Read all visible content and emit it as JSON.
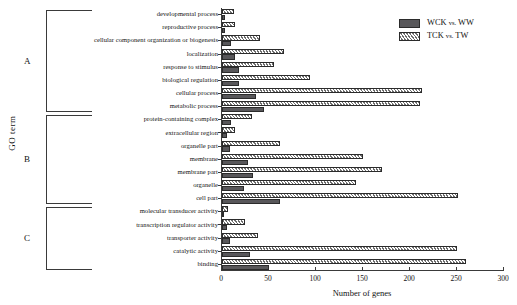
{
  "chart_data": {
    "type": "bar",
    "orientation": "horizontal",
    "title": "",
    "xlabel": "Number of genes",
    "ylabel": "GO term",
    "xlim": [
      0,
      300
    ],
    "xticks": [
      0,
      50,
      100,
      150,
      200,
      250,
      300
    ],
    "grid": false,
    "legend_position": "top-right",
    "categories": [
      "developmental process",
      "reproductive process",
      "cellular component organization or biogenesis",
      "localization",
      "response to stimulus",
      "biological regulation",
      "cellular process",
      "metabolic process",
      "protein-containing complex",
      "extracellular region",
      "organelle part",
      "membrane",
      "membrane part",
      "organelle",
      "cell part",
      "molecular transducer activity",
      "transcription regulator activity",
      "transporter activity",
      "catalytic activity",
      "binding"
    ],
    "series": [
      {
        "name": "WCK vs. WW",
        "values": [
          3,
          3,
          10,
          14,
          18,
          18,
          36,
          45,
          10,
          5,
          8,
          28,
          33,
          23,
          62,
          2,
          5,
          8,
          30,
          50
        ]
      },
      {
        "name": "TCK vs. TW",
        "values": [
          13,
          14,
          40,
          66,
          55,
          94,
          213,
          211,
          32,
          14,
          62,
          150,
          170,
          143,
          251,
          6,
          24,
          38,
          250,
          260
        ]
      }
    ],
    "groups": [
      {
        "id": "A",
        "label": "A",
        "start": 0,
        "end": 7
      },
      {
        "id": "B",
        "label": "B",
        "start": 8,
        "end": 14
      },
      {
        "id": "C",
        "label": "C",
        "start": 15,
        "end": 19
      }
    ]
  },
  "legend": {
    "items": [
      {
        "key": "wck",
        "label_main": "WCK",
        "label_vs": "vs.",
        "label_tail": "WW",
        "full": "WCK vs. WW",
        "color": "#58575a"
      },
      {
        "key": "tck",
        "label_main": "TCK",
        "label_vs": "vs.",
        "label_tail": "TW",
        "full": "TCK vs. TW",
        "color": "#ffffff"
      }
    ]
  }
}
